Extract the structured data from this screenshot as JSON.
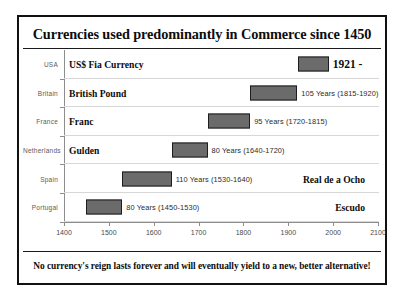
{
  "chart_data": {
    "type": "bar",
    "orientation": "horizontal",
    "subtype": "timeline-range",
    "title": "Currencies used predominantly in Commerce since 1450",
    "footer": "No currency's reign lasts forever and will eventually yield to a new, better alternative!",
    "xlabel": "",
    "ylabel": "",
    "xlim": [
      1400,
      2100
    ],
    "xticks": [
      1400,
      1500,
      1600,
      1700,
      1800,
      1900,
      2000,
      2100
    ],
    "xtick_labels": [
      "1400",
      "1500",
      "1600",
      "1700",
      "1800",
      "1900",
      "2000",
      "2100"
    ],
    "grid": false,
    "legend": "none",
    "categories": [
      "USA",
      "Britain",
      "France",
      "Netherlands",
      "Spain",
      "Portugal"
    ],
    "bar_color": "#6b6b6b",
    "bar_border_color": "#1d1d1d",
    "rows": [
      {
        "category": "USA",
        "currency": "US$ Fia Currency",
        "currency_align": "left",
        "start": 1921,
        "end": 1990,
        "duration_years": null,
        "duration_label": "1921 -",
        "duration_style": "era"
      },
      {
        "category": "Britain",
        "currency": "British Pound",
        "currency_align": "left",
        "start": 1815,
        "end": 1920,
        "duration_years": 105,
        "duration_label": "105 Years (1815-1920)",
        "duration_style": "plain"
      },
      {
        "category": "France",
        "currency": "Franc",
        "currency_align": "left",
        "start": 1720,
        "end": 1815,
        "duration_years": 95,
        "duration_label": "95 Years (1720-1815)",
        "duration_style": "plain"
      },
      {
        "category": "Netherlands",
        "currency": "Gulden",
        "currency_align": "left",
        "start": 1640,
        "end": 1720,
        "duration_years": 80,
        "duration_label": "80 Years (1640-1720)",
        "duration_style": "plain"
      },
      {
        "category": "Spain",
        "currency": "Real de a Ocho",
        "currency_align": "right",
        "start": 1530,
        "end": 1640,
        "duration_years": 110,
        "duration_label": "110 Years (1530-1640)",
        "duration_style": "plain"
      },
      {
        "category": "Portugal",
        "currency": "Escudo",
        "currency_align": "right",
        "start": 1450,
        "end": 1530,
        "duration_years": 80,
        "duration_label": "80 Years (1450-1530)",
        "duration_style": "plain"
      }
    ]
  }
}
